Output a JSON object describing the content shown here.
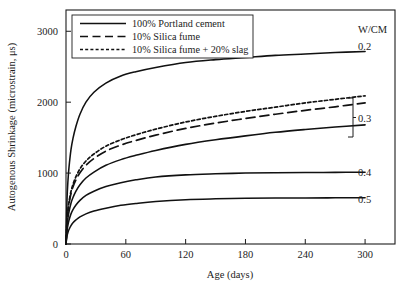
{
  "chart_data": {
    "type": "line",
    "title": "",
    "xlabel": "Age (days)",
    "ylabel": "Autogenous Shrinkage (microstrain, μs)",
    "xlim": [
      0,
      330
    ],
    "ylim": [
      0,
      3300
    ],
    "xticks": [
      0,
      60,
      120,
      180,
      240,
      300
    ],
    "yticks": [
      0,
      1000,
      2000,
      3000
    ],
    "grid": false,
    "legend_position": "top-left",
    "legend": [
      {
        "label": "100% Portland cement",
        "style": "solid"
      },
      {
        "label": "10% Silica fume",
        "style": "dashed"
      },
      {
        "label": "10% Silica fume + 20% slag",
        "style": "dotted"
      }
    ],
    "annotations": [
      {
        "text": "W/CM",
        "x": 318,
        "y": 3130
      },
      {
        "text": "0.2",
        "x": 318,
        "y": 2700
      },
      {
        "text": "0.3",
        "x": 318,
        "y": 1880
      },
      {
        "text": "0.4",
        "x": 318,
        "y": 1010
      },
      {
        "text": "0.5",
        "x": 318,
        "y": 650
      }
    ],
    "x": [
      0,
      1,
      2,
      3,
      5,
      7,
      10,
      14,
      20,
      28,
      40,
      55,
      70,
      90,
      120,
      150,
      180,
      210,
      240,
      270,
      300
    ],
    "series": [
      {
        "name": "W/CM 0.2 - 100% Portland cement",
        "wcm": 0.2,
        "style": "solid",
        "values": [
          0,
          620,
          900,
          1080,
          1330,
          1490,
          1660,
          1830,
          2000,
          2140,
          2270,
          2370,
          2430,
          2490,
          2560,
          2600,
          2630,
          2660,
          2680,
          2700,
          2715
        ]
      },
      {
        "name": "W/CM 0.3 - 10% Silica fume + 20% slag",
        "wcm": 0.3,
        "style": "dotted",
        "values": [
          0,
          330,
          480,
          590,
          740,
          840,
          950,
          1060,
          1170,
          1270,
          1380,
          1470,
          1540,
          1620,
          1720,
          1800,
          1870,
          1930,
          1990,
          2040,
          2090
        ]
      },
      {
        "name": "W/CM 0.3 - 10% Silica fume",
        "wcm": 0.3,
        "style": "dashed",
        "values": [
          0,
          320,
          465,
          570,
          710,
          805,
          905,
          1005,
          1110,
          1205,
          1310,
          1395,
          1460,
          1535,
          1630,
          1705,
          1770,
          1830,
          1885,
          1935,
          1990
        ]
      },
      {
        "name": "W/CM 0.3 - 100% Portland cement",
        "wcm": 0.3,
        "style": "solid",
        "values": [
          0,
          250,
          370,
          455,
          575,
          655,
          745,
          835,
          930,
          1015,
          1110,
          1190,
          1250,
          1320,
          1405,
          1470,
          1525,
          1575,
          1615,
          1650,
          1680
        ]
      },
      {
        "name": "W/CM 0.4 - 100% Portland cement",
        "wcm": 0.4,
        "style": "solid",
        "values": [
          0,
          180,
          270,
          335,
          425,
          485,
          550,
          615,
          685,
          745,
          810,
          865,
          905,
          945,
          975,
          990,
          1000,
          1005,
          1008,
          1010,
          1012
        ]
      },
      {
        "name": "W/CM 0.5 - 100% Portland cement",
        "wcm": 0.5,
        "style": "solid",
        "values": [
          0,
          110,
          165,
          205,
          260,
          300,
          340,
          382,
          425,
          465,
          505,
          545,
          572,
          600,
          625,
          637,
          644,
          648,
          650,
          651,
          652
        ]
      }
    ]
  }
}
